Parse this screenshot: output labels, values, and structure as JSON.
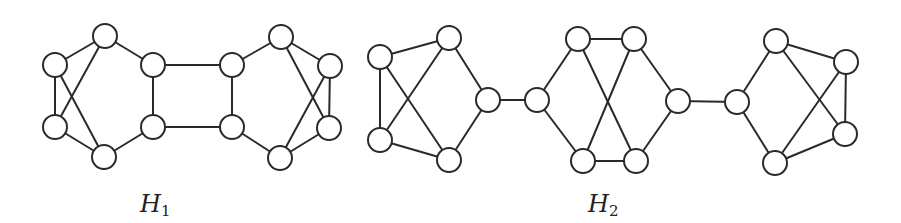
{
  "figure": {
    "background": "#ffffff",
    "stroke_color": "#2a2a2a",
    "node_radius": 12,
    "graphs": [
      {
        "id": "H1",
        "label": {
          "main": "H",
          "sub": "1",
          "x": 140,
          "y": 192
        },
        "nodes": [
          {
            "id": "a1",
            "x": 105,
            "y": 36
          },
          {
            "id": "a2",
            "x": 55,
            "y": 65
          },
          {
            "id": "a3",
            "x": 55,
            "y": 127
          },
          {
            "id": "a4",
            "x": 104,
            "y": 157
          },
          {
            "id": "a5",
            "x": 153,
            "y": 65
          },
          {
            "id": "a6",
            "x": 153,
            "y": 127
          },
          {
            "id": "b1",
            "x": 232,
            "y": 65
          },
          {
            "id": "b2",
            "x": 232,
            "y": 127
          },
          {
            "id": "b3",
            "x": 281,
            "y": 37
          },
          {
            "id": "b4",
            "x": 280,
            "y": 158
          },
          {
            "id": "b5",
            "x": 330,
            "y": 66
          },
          {
            "id": "b6",
            "x": 329,
            "y": 128
          }
        ],
        "edges": [
          [
            "a1",
            "a2"
          ],
          [
            "a2",
            "a3"
          ],
          [
            "a3",
            "a4"
          ],
          [
            "a1",
            "a5"
          ],
          [
            "a4",
            "a6"
          ],
          [
            "a5",
            "a6"
          ],
          [
            "a2",
            "a4"
          ],
          [
            "a1",
            "a3"
          ],
          [
            "a5",
            "b1"
          ],
          [
            "a6",
            "b2"
          ],
          [
            "b1",
            "b2"
          ],
          [
            "b1",
            "b3"
          ],
          [
            "b2",
            "b4"
          ],
          [
            "b3",
            "b5"
          ],
          [
            "b5",
            "b6"
          ],
          [
            "b4",
            "b6"
          ],
          [
            "b3",
            "b6"
          ],
          [
            "b4",
            "b5"
          ]
        ]
      },
      {
        "id": "H2",
        "label": {
          "main": "H",
          "sub": "2",
          "x": 588,
          "y": 192
        },
        "nodes": [
          {
            "id": "c1",
            "x": 380,
            "y": 57
          },
          {
            "id": "c2",
            "x": 449,
            "y": 38
          },
          {
            "id": "c3",
            "x": 488,
            "y": 100
          },
          {
            "id": "c4",
            "x": 380,
            "y": 140
          },
          {
            "id": "c5",
            "x": 449,
            "y": 160
          },
          {
            "id": "d1",
            "x": 537,
            "y": 100
          },
          {
            "id": "d2",
            "x": 578,
            "y": 39
          },
          {
            "id": "d3",
            "x": 634,
            "y": 39
          },
          {
            "id": "d4",
            "x": 678,
            "y": 101
          },
          {
            "id": "d5",
            "x": 583,
            "y": 161
          },
          {
            "id": "d6",
            "x": 636,
            "y": 161
          },
          {
            "id": "e1",
            "x": 737,
            "y": 102
          },
          {
            "id": "e2",
            "x": 776,
            "y": 41
          },
          {
            "id": "e3",
            "x": 846,
            "y": 62
          },
          {
            "id": "e4",
            "x": 845,
            "y": 134
          },
          {
            "id": "e5",
            "x": 775,
            "y": 163
          }
        ],
        "edges": [
          [
            "c1",
            "c2"
          ],
          [
            "c1",
            "c4"
          ],
          [
            "c4",
            "c5"
          ],
          [
            "c2",
            "c3"
          ],
          [
            "c3",
            "c5"
          ],
          [
            "c1",
            "c5"
          ],
          [
            "c2",
            "c4"
          ],
          [
            "c3",
            "d1"
          ],
          [
            "d1",
            "d2"
          ],
          [
            "d2",
            "d3"
          ],
          [
            "d3",
            "d4"
          ],
          [
            "d1",
            "d5"
          ],
          [
            "d5",
            "d6"
          ],
          [
            "d4",
            "d6"
          ],
          [
            "d2",
            "d6"
          ],
          [
            "d3",
            "d5"
          ],
          [
            "d4",
            "e1"
          ],
          [
            "e1",
            "e2"
          ],
          [
            "e2",
            "e3"
          ],
          [
            "e3",
            "e4"
          ],
          [
            "e4",
            "e5"
          ],
          [
            "e1",
            "e5"
          ],
          [
            "e2",
            "e4"
          ],
          [
            "e3",
            "e5"
          ]
        ]
      }
    ]
  }
}
